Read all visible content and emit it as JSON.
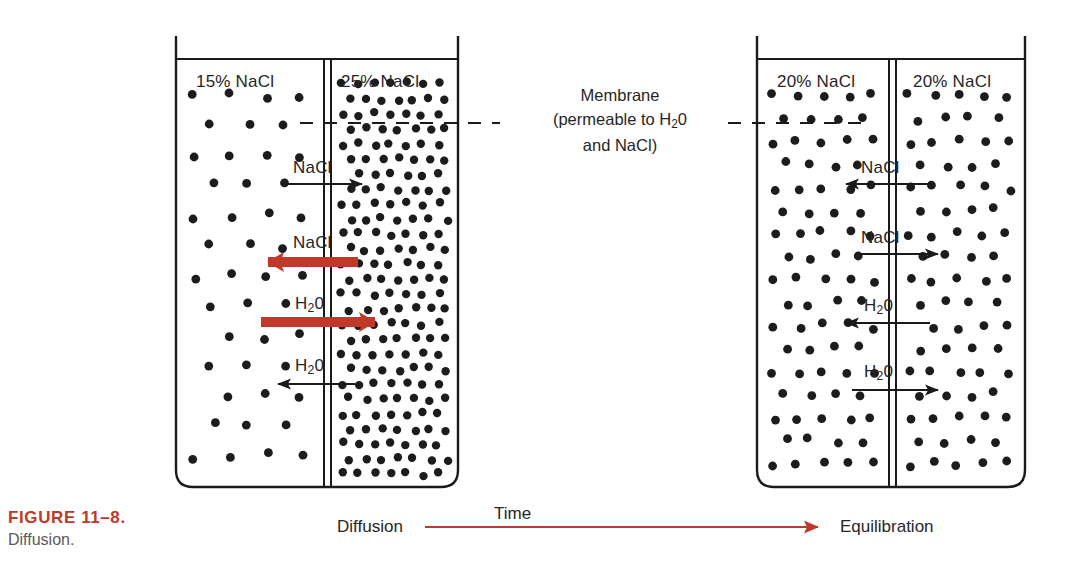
{
  "figure": {
    "number_label": "FIGURE 11–8.",
    "caption": "Diffusion.",
    "number_color": "#c0392b",
    "caption_color": "#5a5a5a"
  },
  "membrane_note": {
    "line1": "Membrane",
    "line2_a": "(permeable to H",
    "line2_sub": "2",
    "line2_b": "0",
    "line3": "and NaCl)"
  },
  "beakers": [
    {
      "id": "left-beaker",
      "state": "diffusion",
      "left_compartment": {
        "label": "15% NaCl",
        "concentration": 15,
        "dot_density": "sparse"
      },
      "right_compartment": {
        "label": "25% NaCl",
        "concentration": 25,
        "dot_density": "dense"
      },
      "flows": [
        {
          "species": "NaCl",
          "direction": "right",
          "style": "thin-black",
          "label": "NaCl"
        },
        {
          "species": "NaCl",
          "direction": "left",
          "style": "thick-red",
          "label": "NaCl"
        },
        {
          "species": "H2O",
          "direction": "right",
          "style": "thick-red",
          "label": "H₂0"
        },
        {
          "species": "H2O",
          "direction": "left",
          "style": "thin-black",
          "label": "H₂0"
        }
      ]
    },
    {
      "id": "right-beaker",
      "state": "equilibration",
      "left_compartment": {
        "label": "20% NaCl",
        "concentration": 20,
        "dot_density": "medium"
      },
      "right_compartment": {
        "label": "20% NaCl",
        "concentration": 20,
        "dot_density": "medium"
      },
      "flows": [
        {
          "species": "NaCl",
          "direction": "left",
          "style": "thin-black",
          "label": "NaCl"
        },
        {
          "species": "NaCl",
          "direction": "right",
          "style": "thin-black",
          "label": "NaCl"
        },
        {
          "species": "H2O",
          "direction": "left",
          "style": "thin-black",
          "label": "H₂0"
        },
        {
          "species": "H2O",
          "direction": "right",
          "style": "thin-black",
          "label": "H₂0"
        }
      ]
    }
  ],
  "timeline": {
    "start_label": "Diffusion",
    "axis_label": "Time",
    "end_label": "Equilibration",
    "arrow_color": "#c0392b"
  },
  "colors": {
    "ink": "#1a1a1a",
    "red": "#c0392b",
    "dot": "#1c1c1c"
  }
}
